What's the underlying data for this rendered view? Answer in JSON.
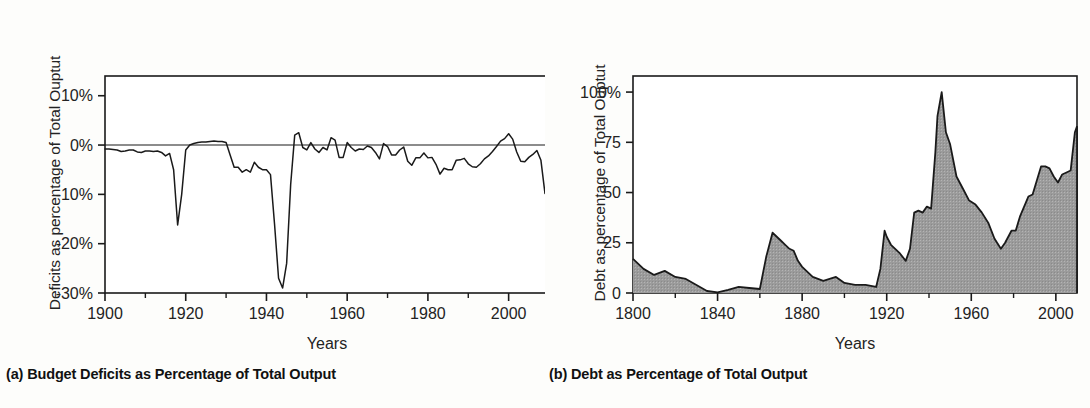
{
  "figure": {
    "panels": [
      {
        "id": "a",
        "caption": "(a) Budget Deficits as Percentage of Total Output",
        "ylabel": "Deficits as percentage of Total Ouptut",
        "xlabel": "Years"
      },
      {
        "id": "b",
        "caption": "(b) Debt as Percentage of Total Output",
        "ylabel": "Debt as percentage of Total Ouptut",
        "xlabel": "Years"
      }
    ]
  },
  "colors": {
    "background": "#fdfdfb",
    "line": "#1a1a1a",
    "fill": "#9b9b9b",
    "axis": "#1a1a1a",
    "text": "#232323"
  },
  "chart_data": [
    {
      "type": "line",
      "title": "(a) Budget Deficits as Percentage of Total Output",
      "xlabel": "Years",
      "ylabel": "Deficits as percentage of Total Ouptut",
      "xlim": [
        1900,
        2010
      ],
      "ylim": [
        -30,
        14
      ],
      "xticks": [
        1900,
        1920,
        1940,
        1960,
        1980,
        2000
      ],
      "xtick_labels": [
        "1900",
        "1920",
        "1940",
        "1960",
        "1980",
        "2000"
      ],
      "xminor_ticks": [
        1910,
        1930,
        1950,
        1970,
        1990,
        2010
      ],
      "yticks": [
        10,
        0,
        -10,
        -20,
        -30
      ],
      "ytick_labels": [
        "10%",
        "0%",
        "-10%",
        "-20%",
        "-30%"
      ],
      "grid": false,
      "zero_line": true,
      "legend": null,
      "series": [
        {
          "name": "Budget deficit (% of GDP)",
          "x": [
            1900,
            1901,
            1902,
            1903,
            1904,
            1905,
            1906,
            1907,
            1908,
            1909,
            1910,
            1911,
            1912,
            1913,
            1914,
            1915,
            1916,
            1917,
            1918,
            1919,
            1920,
            1921,
            1922,
            1923,
            1924,
            1925,
            1926,
            1927,
            1928,
            1929,
            1930,
            1931,
            1932,
            1933,
            1934,
            1935,
            1936,
            1937,
            1938,
            1939,
            1940,
            1941,
            1942,
            1943,
            1944,
            1945,
            1946,
            1947,
            1948,
            1949,
            1950,
            1951,
            1952,
            1953,
            1954,
            1955,
            1956,
            1957,
            1958,
            1959,
            1960,
            1961,
            1962,
            1963,
            1964,
            1965,
            1966,
            1967,
            1968,
            1969,
            1970,
            1971,
            1972,
            1973,
            1974,
            1975,
            1976,
            1977,
            1978,
            1979,
            1980,
            1981,
            1982,
            1983,
            1984,
            1985,
            1986,
            1987,
            1988,
            1989,
            1990,
            1991,
            1992,
            1993,
            1994,
            1995,
            1996,
            1997,
            1998,
            1999,
            2000,
            2001,
            2002,
            2003,
            2004,
            2005,
            2006,
            2007,
            2008,
            2009,
            2010
          ],
          "values": [
            -0.8,
            -0.8,
            -0.9,
            -1.0,
            -1.3,
            -1.2,
            -1.0,
            -1.0,
            -1.4,
            -1.5,
            -1.2,
            -1.2,
            -1.3,
            -1.2,
            -1.5,
            -2.2,
            -1.7,
            -5.0,
            -16.2,
            -10.0,
            -1.0,
            0.0,
            0.3,
            0.5,
            0.6,
            0.6,
            0.7,
            0.8,
            0.7,
            0.7,
            0.5,
            -2.0,
            -4.5,
            -4.5,
            -5.5,
            -5.0,
            -5.5,
            -3.5,
            -4.5,
            -5.0,
            -5.0,
            -6.0,
            -16.0,
            -27.0,
            -29.0,
            -24.0,
            -8.0,
            2.0,
            2.5,
            -0.5,
            -1.0,
            0.5,
            -0.8,
            -1.5,
            -0.5,
            -1.0,
            1.5,
            1.0,
            -2.5,
            -2.5,
            0.5,
            -0.5,
            -1.2,
            -0.8,
            -0.9,
            -0.2,
            -0.5,
            -1.5,
            -2.8,
            0.3,
            -0.3,
            -2.0,
            -2.0,
            -1.0,
            -0.4,
            -3.3,
            -4.1,
            -2.6,
            -2.6,
            -1.6,
            -2.6,
            -2.5,
            -3.9,
            -5.9,
            -4.7,
            -5.0,
            -5.0,
            -3.1,
            -3.0,
            -2.7,
            -3.8,
            -4.4,
            -4.5,
            -3.8,
            -2.8,
            -2.2,
            -1.3,
            -0.3,
            0.8,
            1.3,
            2.3,
            1.2,
            -1.4,
            -3.3,
            -3.4,
            -2.5,
            -1.9,
            -1.1,
            -3.1,
            -9.8,
            -8.7
          ],
          "notes": [
            {
              "year": 1918,
              "value": -16.2,
              "label": "World War I trough"
            },
            {
              "year": 1943,
              "value": -29.0,
              "label": "World War II trough"
            },
            {
              "year": 2000,
              "value": 2.3,
              "label": "surplus peak"
            },
            {
              "year": 2009,
              "value": -9.8,
              "label": "Great Recession"
            }
          ]
        }
      ]
    },
    {
      "type": "area",
      "title": "(b) Debt as Percentage of Total Output",
      "xlabel": "Years",
      "ylabel": "Debt as percentage of Total Ouptut",
      "xlim": [
        1800,
        2010
      ],
      "ylim": [
        0,
        108
      ],
      "xticks": [
        1800,
        1840,
        1880,
        1920,
        1960,
        2000
      ],
      "xtick_labels": [
        "1800",
        "1840",
        "1880",
        "1920",
        "1960",
        "2000"
      ],
      "xminor_ticks": [
        1820,
        1860,
        1900,
        1940,
        1980
      ],
      "yticks": [
        100,
        75,
        50,
        25,
        0
      ],
      "ytick_labels": [
        "100%",
        "75",
        "50",
        "25",
        "0"
      ],
      "grid": false,
      "legend": null,
      "series": [
        {
          "name": "Federal debt held by public (% of GDP)",
          "x": [
            1800,
            1805,
            1810,
            1815,
            1820,
            1825,
            1830,
            1835,
            1840,
            1845,
            1850,
            1855,
            1860,
            1863,
            1866,
            1868,
            1870,
            1872,
            1874,
            1876,
            1878,
            1880,
            1885,
            1890,
            1893,
            1896,
            1900,
            1905,
            1910,
            1915,
            1917,
            1919,
            1920,
            1922,
            1924,
            1926,
            1929,
            1931,
            1933,
            1935,
            1937,
            1939,
            1941,
            1943,
            1944,
            1946,
            1948,
            1950,
            1953,
            1956,
            1959,
            1962,
            1965,
            1968,
            1971,
            1974,
            1976,
            1979,
            1981,
            1983,
            1985,
            1987,
            1989,
            1991,
            1993,
            1995,
            1997,
            1999,
            2001,
            2003,
            2005,
            2007,
            2009,
            2010
          ],
          "values": [
            17,
            12,
            9,
            11,
            8,
            7,
            4,
            1,
            0.3,
            1.5,
            3,
            2.5,
            2,
            18,
            30,
            28,
            26,
            24,
            22,
            21,
            16,
            13,
            8,
            6,
            7,
            8,
            5,
            4,
            4,
            3,
            12,
            31,
            28,
            24,
            22,
            20,
            16,
            22,
            40,
            41,
            40,
            43,
            42,
            70,
            88,
            100,
            80,
            74,
            58,
            52,
            46,
            44,
            40,
            35,
            27,
            22,
            25,
            31,
            31,
            38,
            43,
            48,
            49,
            56,
            63,
            63,
            62,
            58,
            55,
            59,
            60,
            61,
            80,
            83
          ],
          "notes": [
            {
              "year": 1866,
              "value": 30,
              "label": "Civil War peak"
            },
            {
              "year": 1919,
              "value": 31,
              "label": "World War I peak"
            },
            {
              "year": 1946,
              "value": 100,
              "label": "World War II peak"
            },
            {
              "year": 1974,
              "value": 22,
              "label": "post-war trough"
            },
            {
              "year": 2010,
              "value": 83,
              "label": "recent level"
            }
          ]
        }
      ]
    }
  ]
}
